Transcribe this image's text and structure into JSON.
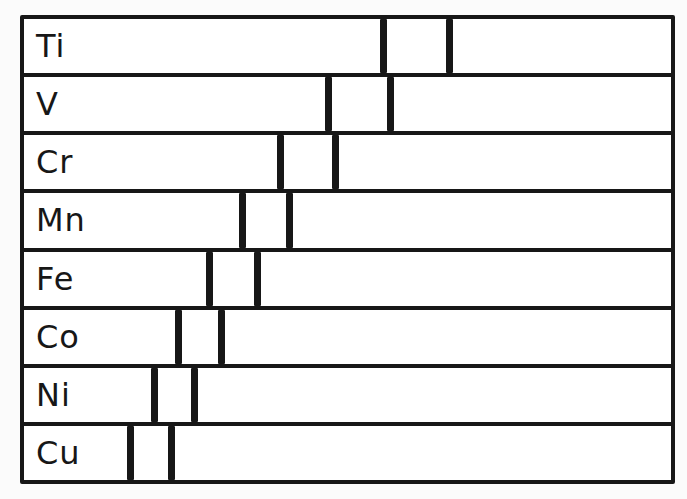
{
  "figure": {
    "background_color": "#fbfbfb",
    "ink_color": "#171717",
    "frame": {
      "left": 20,
      "top": 15,
      "width": 655,
      "height": 469,
      "border_px": 4
    },
    "line_bar_width_px": 7,
    "rows": [
      {
        "element": "Ti",
        "lines_x": [
          383,
          449
        ]
      },
      {
        "element": "V",
        "lines_x": [
          328,
          390
        ]
      },
      {
        "element": "Cr",
        "lines_x": [
          280,
          335
        ]
      },
      {
        "element": "Mn",
        "lines_x": [
          242,
          289
        ]
      },
      {
        "element": "Fe",
        "lines_x": [
          209,
          257
        ]
      },
      {
        "element": "Co",
        "lines_x": [
          178,
          221
        ]
      },
      {
        "element": "Ni",
        "lines_x": [
          154,
          194
        ]
      },
      {
        "element": "Cu",
        "lines_x": [
          130,
          171
        ]
      }
    ]
  }
}
